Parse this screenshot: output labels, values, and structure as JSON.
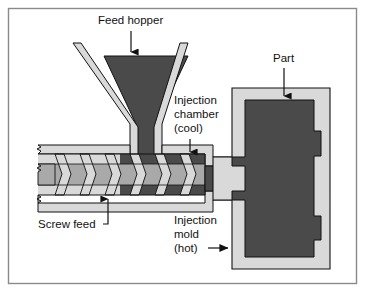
{
  "figure": {
    "title_visible": false,
    "kind": "technical-cross-section-diagram"
  },
  "frame": {
    "border_color": "#8a8a8a",
    "background_color": "#ffffff"
  },
  "palette": {
    "dark_fill": "#4a4a4a",
    "mid_gray_fill": "#a9a9a9",
    "light_gray_fill": "#d9d9d9",
    "outline": "#111111",
    "text": "#111111",
    "leader_line": "#111111"
  },
  "labels": {
    "feed_hopper": {
      "text": "Feed hopper",
      "pointer": "down-arrow"
    },
    "injection_chamber": {
      "line1": "Injection",
      "line2": "chamber",
      "line3": "(cool)",
      "pointer": "down-arrow"
    },
    "part": {
      "text": "Part",
      "pointer": "down-arrow"
    },
    "screw_feed": {
      "text": "Screw feed",
      "pointer": "up-arrow-with-elbow-leader"
    },
    "injection_mold": {
      "line1": "Injection",
      "line2": "mold",
      "line3": "(hot)",
      "pointer": "right-arrow"
    }
  },
  "components": [
    {
      "name": "feed-hopper",
      "fill": "dark",
      "wall": "light-gray"
    },
    {
      "name": "barrel",
      "fill": "light-gray",
      "wall": "light-gray"
    },
    {
      "name": "screw",
      "fill": "mid-gray",
      "flights": 6
    },
    {
      "name": "injection-chamber",
      "fill": "dark"
    },
    {
      "name": "nozzle",
      "fill": "dark"
    },
    {
      "name": "injection-mold",
      "fill": "light-gray"
    },
    {
      "name": "molded-part",
      "fill": "dark"
    }
  ]
}
